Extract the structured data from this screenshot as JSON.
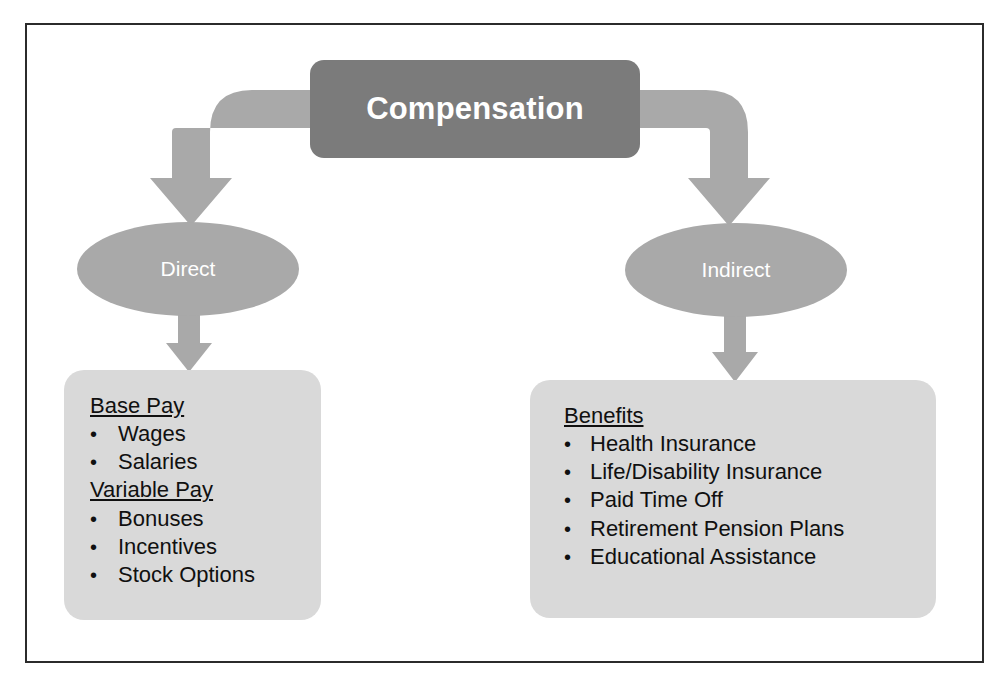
{
  "diagram": {
    "title_node": {
      "label": "Compensation"
    },
    "branches": [
      {
        "label": "Direct"
      },
      {
        "label": "Indirect"
      }
    ],
    "left_box": {
      "groups": [
        {
          "heading": "Base Pay",
          "items": [
            "Wages",
            "Salaries"
          ]
        },
        {
          "heading": "Variable Pay",
          "items": [
            "Bonuses",
            "Incentives",
            "Stock Options"
          ]
        }
      ]
    },
    "right_box": {
      "groups": [
        {
          "heading": "Benefits",
          "items": [
            "Health Insurance",
            "Life/Disability Insurance",
            "Paid Time Off",
            "Retirement Pension Plans",
            "Educational Assistance"
          ]
        }
      ]
    },
    "bullet_glyph": "•",
    "colors": {
      "title_node_fill": "#7b7b7b",
      "ellipse_fill": "#a9a9a9",
      "box_fill": "#d9d9d9",
      "arrow_fill": "#a9a9a9",
      "frame_stroke": "#2b2b2b",
      "node_text": "#ffffff",
      "body_text": "#101010",
      "page_background": "#ffffff"
    }
  }
}
